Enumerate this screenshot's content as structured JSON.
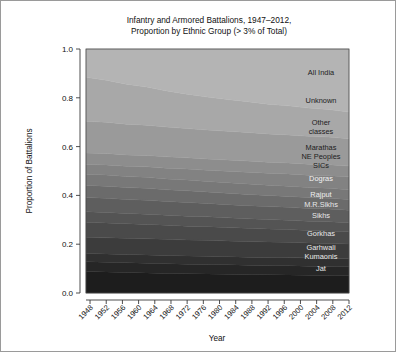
{
  "figure": {
    "title_line1": "Infantry and Armored Battalions, 1947–2012,",
    "title_line2": "Proportion by Ethnic Group (> 3% of Total)",
    "background_color": "#ffffff",
    "border_color": "#9a9a9a"
  },
  "chart_data": {
    "type": "area",
    "title": "Infantry and Armored Battalions, 1947–2012, Proportion by Ethnic Group (> 3% of Total)",
    "xlabel": "Year",
    "ylabel": "Proportion of Battalions",
    "xlim": [
      1947,
      2012
    ],
    "ylim": [
      0.0,
      1.0
    ],
    "grid": false,
    "legend": "inline-right-labels",
    "stacked": true,
    "normalized": true,
    "x_tick_labels": [
      "1948",
      "1952",
      "1956",
      "1960",
      "1964",
      "1968",
      "1972",
      "1976",
      "1980",
      "1984",
      "1988",
      "1992",
      "1996",
      "2000",
      "2004",
      "2008",
      "2012"
    ],
    "x_tick_values": [
      1948,
      1952,
      1956,
      1960,
      1964,
      1968,
      1972,
      1976,
      1980,
      1984,
      1988,
      1992,
      1996,
      2000,
      2004,
      2008,
      2012
    ],
    "y_tick_labels": [
      "0.0",
      "0.2",
      "0.4",
      "0.6",
      "0.8",
      "1.0"
    ],
    "y_tick_values": [
      0.0,
      0.2,
      0.4,
      0.6,
      0.8,
      1.0
    ],
    "x": [
      1947,
      1952,
      1957,
      1962,
      1967,
      1972,
      1977,
      1982,
      1987,
      1992,
      1997,
      2002,
      2007,
      2012
    ],
    "series": [
      {
        "name": "Jat",
        "label": "Jat",
        "color": "#1d1d1d",
        "label_color": "#e8e8e8",
        "values": [
          0.088,
          0.086,
          0.084,
          0.082,
          0.08,
          0.079,
          0.078,
          0.077,
          0.076,
          0.075,
          0.074,
          0.073,
          0.072,
          0.071
        ]
      },
      {
        "name": "Kumaonis",
        "label": "Kumaonis",
        "color": "#262626",
        "label_color": "#e8e8e8",
        "values": [
          0.04,
          0.04,
          0.04,
          0.04,
          0.04,
          0.039,
          0.039,
          0.039,
          0.038,
          0.038,
          0.038,
          0.037,
          0.037,
          0.037
        ]
      },
      {
        "name": "Garhwali",
        "label": "Garhwali",
        "color": "#303030",
        "label_color": "#e8e8e8",
        "values": [
          0.034,
          0.034,
          0.034,
          0.034,
          0.034,
          0.034,
          0.034,
          0.033,
          0.033,
          0.033,
          0.033,
          0.033,
          0.032,
          0.032
        ]
      },
      {
        "name": "Gorkhas",
        "label": "Gorkhas",
        "color": "#3c3c3c",
        "label_color": "#e8e8e8",
        "values": [
          0.066,
          0.066,
          0.066,
          0.066,
          0.066,
          0.065,
          0.065,
          0.064,
          0.064,
          0.063,
          0.063,
          0.062,
          0.062,
          0.061
        ]
      },
      {
        "name": "Sikhs",
        "label": "Sikhs",
        "color": "#4a4a4a",
        "label_color": "#e8e8e8",
        "values": [
          0.062,
          0.061,
          0.06,
          0.059,
          0.058,
          0.057,
          0.056,
          0.055,
          0.054,
          0.053,
          0.052,
          0.051,
          0.051,
          0.05
        ]
      },
      {
        "name": "M.R.Sikhs",
        "label": "M.R.Sikhs",
        "color": "#545454",
        "label_color": "#e8e8e8",
        "values": [
          0.043,
          0.043,
          0.042,
          0.042,
          0.041,
          0.041,
          0.04,
          0.04,
          0.039,
          0.039,
          0.038,
          0.038,
          0.038,
          0.037
        ]
      },
      {
        "name": "Rajput",
        "label": "Rajput",
        "color": "#5e5e5e",
        "label_color": "#efefef",
        "values": [
          0.058,
          0.058,
          0.057,
          0.057,
          0.056,
          0.056,
          0.055,
          0.054,
          0.054,
          0.053,
          0.053,
          0.052,
          0.052,
          0.051
        ]
      },
      {
        "name": "Dogras",
        "label": "Dogras",
        "color": "#6b6b6b",
        "label_color": "#f2f2f2",
        "values": [
          0.05,
          0.05,
          0.049,
          0.049,
          0.048,
          0.048,
          0.047,
          0.047,
          0.046,
          0.046,
          0.045,
          0.045,
          0.044,
          0.044
        ]
      },
      {
        "name": "SICs",
        "label": "SICs",
        "color": "#787878",
        "label_color": "#1c1c1c",
        "values": [
          0.046,
          0.046,
          0.045,
          0.045,
          0.044,
          0.044,
          0.043,
          0.043,
          0.043,
          0.042,
          0.042,
          0.041,
          0.041,
          0.04
        ]
      },
      {
        "name": "NE Peoples",
        "label": "NE Peoples",
        "color": "#828282",
        "label_color": "#1c1c1c",
        "values": [
          0.04,
          0.041,
          0.042,
          0.043,
          0.044,
          0.045,
          0.046,
          0.047,
          0.048,
          0.049,
          0.05,
          0.051,
          0.052,
          0.053
        ]
      },
      {
        "name": "Marathas",
        "label": "Marathas",
        "color": "#8d8d8d",
        "label_color": "#1c1c1c",
        "values": [
          0.047,
          0.047,
          0.047,
          0.047,
          0.047,
          0.046,
          0.046,
          0.046,
          0.046,
          0.045,
          0.045,
          0.045,
          0.045,
          0.044
        ]
      },
      {
        "name": "Other classes",
        "label_line1": "Other",
        "label_line2": "classes",
        "color": "#9a9a9a",
        "label_color": "#1c1c1c",
        "values": [
          0.13,
          0.128,
          0.126,
          0.124,
          0.122,
          0.12,
          0.119,
          0.118,
          0.117,
          0.116,
          0.115,
          0.114,
          0.113,
          0.112
        ]
      },
      {
        "name": "Unknown",
        "label": "Unknown",
        "color": "#a8a8a8",
        "label_color": "#1c1c1c",
        "values": [
          0.18,
          0.172,
          0.164,
          0.156,
          0.148,
          0.141,
          0.135,
          0.13,
          0.126,
          0.122,
          0.119,
          0.116,
          0.113,
          0.11
        ]
      },
      {
        "name": "All India",
        "label": "All India",
        "color": "#b4b4b4",
        "label_color": "#1c1c1c",
        "values": [
          0.116,
          0.128,
          0.144,
          0.156,
          0.172,
          0.185,
          0.197,
          0.207,
          0.216,
          0.226,
          0.233,
          0.242,
          0.248,
          0.258
        ]
      }
    ],
    "band_labels": [
      {
        "text": "All India",
        "y": 0.905,
        "color": "#1c1c1c"
      },
      {
        "text": "Unknown",
        "y": 0.788,
        "color": "#1c1c1c"
      },
      {
        "text": "Other",
        "y": 0.7,
        "color": "#1c1c1c"
      },
      {
        "text": "classes",
        "y": 0.663,
        "color": "#1c1c1c"
      },
      {
        "text": "Marathas",
        "y": 0.598,
        "color": "#1c1c1c"
      },
      {
        "text": "NE Peoples",
        "y": 0.561,
        "color": "#1c1c1c"
      },
      {
        "text": "SICs",
        "y": 0.524,
        "color": "#1c1c1c"
      },
      {
        "text": "Dogras",
        "y": 0.47,
        "color": "#f2f2f2"
      },
      {
        "text": "Rajput",
        "y": 0.403,
        "color": "#efefef"
      },
      {
        "text": "M.R.Sikhs",
        "y": 0.362,
        "color": "#e8e8e8"
      },
      {
        "text": "Sikhs",
        "y": 0.32,
        "color": "#e8e8e8"
      },
      {
        "text": "Gorkhas",
        "y": 0.243,
        "color": "#e8e8e8"
      },
      {
        "text": "Garhwali",
        "y": 0.186,
        "color": "#e8e8e8"
      },
      {
        "text": "Kumaonis",
        "y": 0.152,
        "color": "#e8e8e8"
      },
      {
        "text": "Jat",
        "y": 0.1,
        "color": "#e8e8e8"
      }
    ]
  }
}
